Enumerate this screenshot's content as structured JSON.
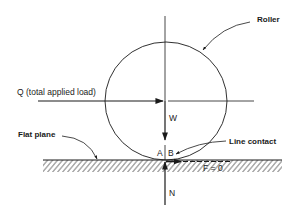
{
  "diagram": {
    "labels": {
      "roller": "Roller",
      "applied_load": "Q (total applied load)",
      "weight": "W",
      "flat_plane": "Flat plane",
      "line_contact": "Line contact",
      "point_a": "A",
      "point_b": "B",
      "friction": "F = 0",
      "normal": "N"
    },
    "colors": {
      "line": "#1a1a1a",
      "background": "#ffffff"
    }
  }
}
